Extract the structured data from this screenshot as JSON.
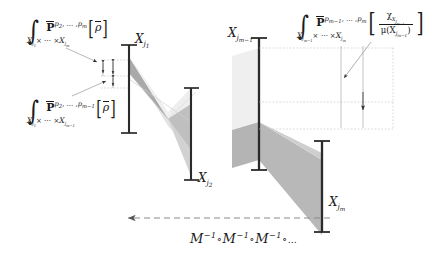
{
  "figure": {
    "domain": "mathematical-diagram",
    "background_color": "#ffffff",
    "ink_color": "#1a1a1a",
    "fill_light": "#e9e9e9",
    "fill_mid": "#c9c9c9",
    "fill_dark": "#9e9e9e",
    "width": 438,
    "height": 259
  },
  "annotations": {
    "top_left_integral": {
      "integral": "∫",
      "limit": "X",
      "limit_sub_1": "j",
      "limit_sub_1b": "1",
      "limit_mid": "× ⋯ ×",
      "limit_2": "X",
      "limit_2_sub": "j",
      "limit_2_subsub": "m",
      "operator": "P",
      "operator_sup_a": "p",
      "operator_sup_a_sub": "2",
      "operator_sup_mid": ", … ,",
      "operator_sup_b": "p",
      "operator_sup_b_sub": "m",
      "bracket_open": "[",
      "argument": "ρ",
      "bracket_close": "]",
      "full_text": "∫_{X_{j1}×⋯×X_{jm}} P̄^{p2,…,pm}[ρ̄]"
    },
    "mid_left_integral": {
      "integral": "∫",
      "limit": "X",
      "limit_sub_1": "j",
      "limit_sub_1b": "1",
      "limit_mid": "× ⋯ ×",
      "limit_2": "X",
      "limit_2_sub": "j",
      "limit_2_subsub": "m−1",
      "operator": "P",
      "operator_sup_a": "p",
      "operator_sup_a_sub": "2",
      "operator_sup_mid": ", … ,",
      "operator_sup_b": "p",
      "operator_sup_b_sub": "m−1",
      "bracket_open": "[",
      "argument": "ρ",
      "bracket_close": "]",
      "full_text": "∫_{X_{j1}×⋯×X_{j(m−1)}} P̄^{p2,…,p(m−1)}[ρ̄]"
    },
    "top_right_integral": {
      "integral": "∫",
      "limit": "X",
      "limit_sub": "j",
      "limit_subsub": "m−1",
      "limit_mid": "× ⋯ ×",
      "limit_2": "X",
      "limit_2_sub": "j",
      "limit_2_subsub": "m",
      "operator": "P",
      "operator_sup_a": "p",
      "operator_sup_a_sub": "m−1",
      "operator_sup_mid": ", … ,",
      "operator_sup_b": "p",
      "operator_sup_b_sub": "m",
      "bracket_open": "[",
      "numerator": "χ",
      "numerator_sub": "X",
      "numerator_subsub": "j",
      "numerator_subsubsub": "m−1",
      "denominator": "μ(X",
      "denominator_sub": "j",
      "denominator_subsub": "m−1",
      "denominator_close": ")",
      "bracket_close": "]",
      "full_text": "∫_{X_{j(m−1)}×⋯×X_{jm}} P̄^{p(m−1),…,pm}[ χ_{X_{j(m−1)}} / μ(X_{j(m−1)}) ]"
    }
  },
  "left_diagram": {
    "name": "left-fiber-diagram",
    "bar_top_label": {
      "symbol": "X",
      "sub": "j",
      "subsub": "1",
      "text": "X_{j₁}"
    },
    "bar_bottom_label": {
      "symbol": "X",
      "sub": "j",
      "subsub": "2",
      "text": "X_{j₂}"
    }
  },
  "right_diagram": {
    "name": "right-fiber-diagram",
    "bar_top_label": {
      "symbol": "X",
      "sub": "j",
      "subsub": "m−1",
      "text": "X_{j_{m−1}}"
    },
    "bar_bottom_label": {
      "symbol": "X",
      "sub": "j",
      "subsub": "m",
      "text": "X_{j_m}"
    }
  },
  "bottom_arrow": {
    "name": "composition-arrow",
    "direction": "leftward",
    "style": "dashed",
    "label_m": "M",
    "label_sup": "−1",
    "label_circ": "∘",
    "label_ellipsis": "…",
    "full_text": "M⁻¹ ∘ M⁻¹ ∘ M⁻¹ ∘ …"
  }
}
